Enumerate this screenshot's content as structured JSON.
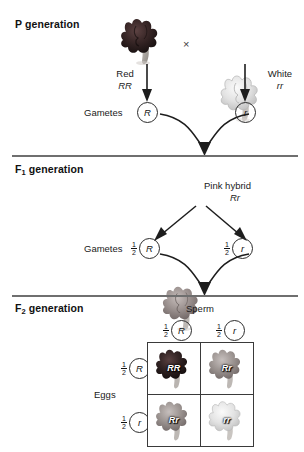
{
  "figure": {
    "title_p": "P generation",
    "title_f1": "F",
    "title_f1_sub": "1",
    "title_f1_rest": " generation",
    "title_f2": "F",
    "title_f2_sub": "2",
    "title_f2_rest": " generation",
    "cross_symbol": "×"
  },
  "p_generation": {
    "label": "P generation",
    "parent_left": {
      "phenotype": "Red",
      "genotype": "RR",
      "flower_color": "#3a2a2a"
    },
    "parent_right": {
      "phenotype": "White",
      "genotype": "rr",
      "flower_color": "#d8d8d8"
    },
    "gametes_label": "Gametes",
    "gamete_left": "R",
    "gamete_right": "r"
  },
  "f1_generation": {
    "label_main": "F",
    "label_sub": "1",
    "label_rest": " generation",
    "offspring": {
      "phenotype": "Pink hybrid",
      "genotype": "Rr",
      "flower_color": "#9a8f8f"
    },
    "gametes_label": "Gametes",
    "gamete_left": {
      "fraction_num": "1",
      "fraction_den": "2",
      "allele": "R"
    },
    "gamete_right": {
      "fraction_num": "1",
      "fraction_den": "2",
      "allele": "r"
    }
  },
  "f2_generation": {
    "label_main": "F",
    "label_sub": "2",
    "label_rest": " generation",
    "sperm_label": "Sperm",
    "eggs_label": "Eggs",
    "columns": [
      {
        "fraction_num": "1",
        "fraction_den": "2",
        "allele": "R"
      },
      {
        "fraction_num": "1",
        "fraction_den": "2",
        "allele": "r"
      }
    ],
    "rows": [
      {
        "fraction_num": "1",
        "fraction_den": "2",
        "allele": "R"
      },
      {
        "fraction_num": "1",
        "fraction_den": "2",
        "allele": "r"
      }
    ],
    "punnett_cells": [
      {
        "genotype": "RR",
        "flower_color": "#2e2222",
        "phenotype": "red"
      },
      {
        "genotype": "Rr",
        "flower_color": "#9a9090",
        "phenotype": "pink"
      },
      {
        "genotype": "Rr",
        "flower_color": "#9a9090",
        "phenotype": "pink"
      },
      {
        "genotype": "rr",
        "flower_color": "#d9d9d9",
        "phenotype": "white"
      }
    ]
  },
  "colors": {
    "rule": "#6f6f6f",
    "text": "#141414",
    "circle_stroke": "#2b2b2b",
    "grid_stroke": "#3a3a3a"
  }
}
